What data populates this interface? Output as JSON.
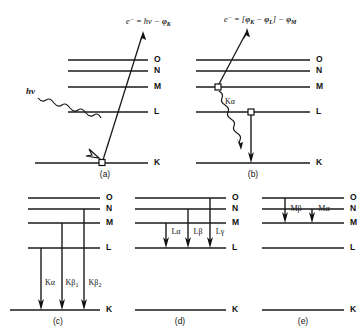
{
  "figure": {
    "background_color": "#ffffff",
    "line_color": "#1a1a1a",
    "shell_names": [
      "O",
      "N",
      "M",
      "L",
      "K"
    ]
  },
  "panels": [
    {
      "id": "a",
      "caption": "(a)",
      "description": "Photoelectric absorption: incident photon ejects a K-shell electron",
      "shells": [
        "O",
        "N",
        "M",
        "L",
        "K"
      ],
      "incoming_label": "hν",
      "ejected_label_parts": {
        "particle": "e",
        "charge": "−",
        "equals": "=",
        "energy": "hν",
        "minus": "−",
        "work": "φ",
        "work_sub": "K"
      },
      "ejected_label_plain": "e⁻ = hν − φK",
      "vacancy_shell": "K"
    },
    {
      "id": "b",
      "caption": "(b)",
      "description": "Auger electron emission following K-shell vacancy filling",
      "shells": [
        "O",
        "N",
        "M",
        "L",
        "K"
      ],
      "ejected_label_parts": {
        "particle": "e",
        "charge": "−",
        "equals": "=",
        "bracket_open": "[",
        "phi1": "φ",
        "phi1_sub": "K",
        "minus1": "−",
        "phi2": "φ",
        "phi2_sub": "L",
        "bracket_close": "]",
        "minus2": "−",
        "phi3": "φ",
        "phi3_sub": "M"
      },
      "ejected_label_plain": "e⁻ = [φK − φL] − φM",
      "internal_photon_label": "Kα",
      "vacancy_shells": [
        "M",
        "L"
      ],
      "transition": {
        "from": "L",
        "to": "K"
      }
    },
    {
      "id": "c",
      "caption": "(c)",
      "description": "K series X-ray emission lines",
      "shells": [
        "O",
        "N",
        "M",
        "L",
        "K"
      ],
      "transitions": [
        {
          "label": "Kα",
          "label_base": "Kα",
          "label_sub": "",
          "from": "L",
          "to": "K"
        },
        {
          "label": "Kβ₁",
          "label_base": "Kβ",
          "label_sub": "1",
          "from": "M",
          "to": "K"
        },
        {
          "label": "Kβ₂",
          "label_base": "Kβ",
          "label_sub": "2",
          "from": "N",
          "to": "K"
        }
      ]
    },
    {
      "id": "d",
      "caption": "(d)",
      "description": "L series X-ray emission lines",
      "shells": [
        "O",
        "N",
        "M",
        "L",
        "K"
      ],
      "transitions": [
        {
          "label": "Lα",
          "label_base": "Lα",
          "label_sub": "",
          "from": "M",
          "to": "L"
        },
        {
          "label": "Lβ",
          "label_base": "Lβ",
          "label_sub": "",
          "from": "N",
          "to": "L"
        },
        {
          "label": "Lγ",
          "label_base": "Lγ",
          "label_sub": "",
          "from": "O",
          "to": "L"
        }
      ]
    },
    {
      "id": "e",
      "caption": "(e)",
      "description": "M series X-ray emission lines",
      "shells": [
        "O",
        "N",
        "M",
        "L",
        "K"
      ],
      "transitions": [
        {
          "label": "Mβ",
          "label_base": "Mβ",
          "label_sub": "",
          "from": "O",
          "to": "M"
        },
        {
          "label": "Mα",
          "label_base": "Mα",
          "label_sub": "",
          "from": "N",
          "to": "M"
        }
      ]
    }
  ]
}
